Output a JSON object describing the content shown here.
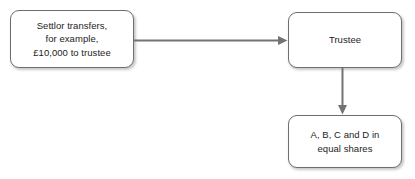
{
  "diagram": {
    "background_color": "#ffffff",
    "node_border_color": "#6e6e6e",
    "edge_color": "#737373",
    "text_color": "#1c1c1c",
    "nodes": [
      {
        "id": "settlor",
        "label": "Settlor transfers,\nfor example,\n£10,000 to trustee"
      },
      {
        "id": "trustee",
        "label": "Trustee"
      },
      {
        "id": "beneficiaries",
        "label": "A, B, C and D in\nequal shares"
      }
    ],
    "edges": [
      {
        "id": "settlor-to-trustee",
        "from": "settlor",
        "to": "trustee",
        "direction": "right",
        "arrowhead": "filled-triangle"
      },
      {
        "id": "trustee-to-beneficiaries",
        "from": "trustee",
        "to": "beneficiaries",
        "direction": "down",
        "arrowhead": "filled-triangle"
      }
    ]
  }
}
